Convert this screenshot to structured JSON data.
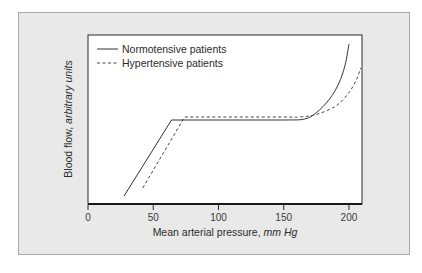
{
  "chart_data": {
    "type": "line",
    "title": "",
    "xlabel": "Mean arterial pressure, mm Hg",
    "xlabel_main": "Mean arterial pressure, ",
    "xlabel_unit": "mm Hg",
    "ylabel": "Blood flow, arbitrary units",
    "ylabel_main": "Blood flow, ",
    "ylabel_unit": "arbitrary units",
    "xlim": [
      0,
      210
    ],
    "ylim": [
      0,
      100
    ],
    "x_ticks": [
      0,
      50,
      100,
      150,
      200
    ],
    "x_tick_labels": [
      "0",
      "50",
      "100",
      "150",
      "200"
    ],
    "y_ticks": [],
    "grid": false,
    "legend_position": "upper left",
    "series": [
      {
        "name": "Normotensive patients",
        "style": "solid",
        "color": "#333333",
        "x": [
          27.6,
          64,
          100,
          150,
          166,
          175,
          185,
          192,
          197,
          200
        ],
        "y": [
          4.7,
          49.7,
          49.7,
          49.7,
          50.3,
          54,
          62,
          71,
          82,
          94.7
        ]
      },
      {
        "name": "Hypertensive patients",
        "style": "dashed",
        "color": "#444444",
        "x": [
          42,
          74,
          100,
          150,
          162,
          175,
          190,
          200,
          206,
          209
        ],
        "y": [
          9.5,
          51.5,
          51.5,
          51.5,
          51.5,
          53,
          58,
          66,
          74,
          80.5
        ]
      }
    ]
  },
  "legend": {
    "items": [
      {
        "label": "Normotensive patients",
        "style": "solid"
      },
      {
        "label": "Hypertensive patients",
        "style": "dashed"
      }
    ]
  },
  "colors": {
    "frame_background": "#e9e9e9",
    "frame_border": "#a9a9a9",
    "plot_background": "#ffffff",
    "axis": "#1a1a1a"
  }
}
